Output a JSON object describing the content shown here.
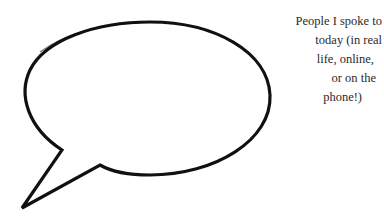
{
  "caption": {
    "lines": [
      "People I spoke to",
      "today (in real",
      "life, online,",
      "or on the",
      "phone!)"
    ]
  },
  "bubble": {
    "shape": "speech-bubble",
    "stroke_color": "#111111",
    "fill_color": "#ffffff",
    "content": ""
  }
}
